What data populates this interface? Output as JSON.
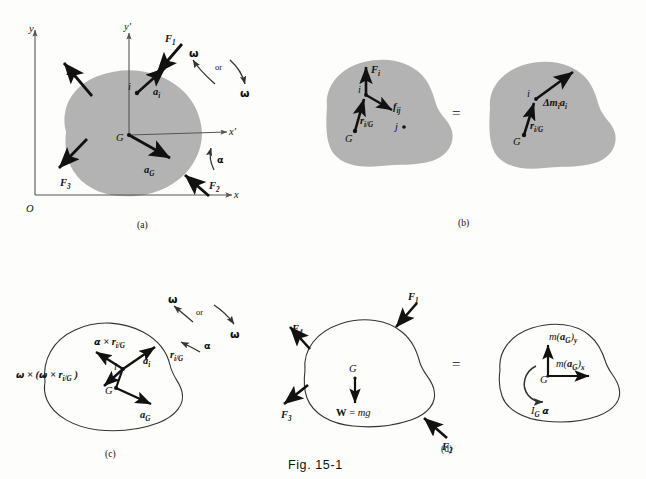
{
  "figure": {
    "caption": "Fig. 15-1",
    "panel_tags": [
      "(a)",
      "(b)",
      "(c)",
      "(d)"
    ],
    "equals_sign": "=",
    "or_word": "or"
  },
  "colors": {
    "body_fill_shaded": "#b3b3b3",
    "body_fill_outline": "#ffffff",
    "stroke": "#111111",
    "axis": "#555555",
    "page": "#fdfdfc"
  },
  "panel_a": {
    "tag": "(a)",
    "axes": {
      "origin_label": "O",
      "x_label": "x",
      "y_label": "y",
      "x_prime_label": "x'",
      "y_prime_label": "y'"
    },
    "center_of_mass": "G",
    "particle": "i",
    "forces": [
      "F",
      "F",
      "F",
      "F"
    ],
    "force_labels": [
      {
        "name": "F",
        "sub": "1"
      },
      {
        "name": "F",
        "sub": "2"
      },
      {
        "name": "F",
        "sub": "3"
      },
      {
        "name": "F",
        "sub": "4"
      }
    ],
    "accel_particle": {
      "name": "a",
      "sub": "i"
    },
    "accel_center": {
      "name": "a",
      "sub": "G"
    },
    "omega": "ω",
    "alpha": "α",
    "or_word": "or"
  },
  "panel_b": {
    "tag": "(b)",
    "equals": "=",
    "left": {
      "center_of_mass": "G",
      "particle": "i",
      "other_particle": "j",
      "external_force": {
        "name": "F",
        "sub": "i"
      },
      "internal_force": {
        "name": "f",
        "sub": "ij"
      },
      "position_vector": {
        "name": "r",
        "sub": "i/G"
      }
    },
    "right": {
      "center_of_mass": "G",
      "particle": "i",
      "momentum_vector": {
        "prefix": "Δm",
        "sub1": "i",
        "name": "a",
        "sub2": "i"
      },
      "position_vector": {
        "name": "r",
        "sub": "i/G"
      }
    }
  },
  "panel_c": {
    "tag": "(c)",
    "center_of_mass": "G",
    "particle": "i",
    "omega": "ω",
    "alpha": "α",
    "or_word": "or",
    "labels": {
      "tangential": {
        "greek": "α",
        "cross": "×",
        "name": "r",
        "sub": "i/G"
      },
      "normal": {
        "greek": "ω",
        "cross": "×",
        "name": "r",
        "sub": "i/G"
      },
      "normal_full": "ω × (ω × r",
      "position_vector": {
        "name": "r",
        "sub": "i/G"
      },
      "accel_particle": {
        "name": "a",
        "sub": "i"
      },
      "accel_center": {
        "name": "a",
        "sub": "G"
      }
    }
  },
  "panel_d": {
    "tag": "(d)",
    "equals": "=",
    "free_body": {
      "center_of_mass": "G",
      "weight": {
        "bold": "W",
        "eq": "=",
        "italic": "mg"
      },
      "force_labels": [
        {
          "name": "F",
          "sub": "1"
        },
        {
          "name": "F",
          "sub": "2"
        },
        {
          "name": "F",
          "sub": "3"
        },
        {
          "name": "F",
          "sub": "4"
        }
      ]
    },
    "kinetic": {
      "center_of_mass": "G",
      "ma_y": {
        "m": "m(",
        "vec": "a",
        "sub": "G",
        "close": ")",
        "comp": "y"
      },
      "ma_x": {
        "m": "m(",
        "vec": "a",
        "sub": "G",
        "close": ")",
        "comp": "x"
      },
      "moment": {
        "I": "I",
        "sub": "G",
        "greek": "α"
      }
    }
  }
}
